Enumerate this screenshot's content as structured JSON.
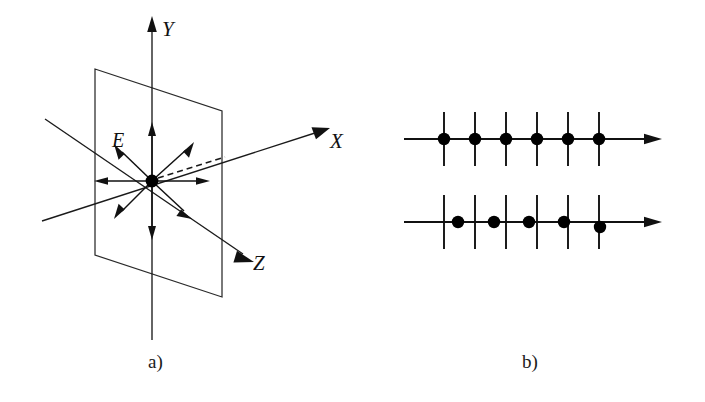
{
  "figure": {
    "background_color": "#ffffff",
    "ink_color": "#111111",
    "panels": [
      {
        "id": "a",
        "caption": "a)",
        "caption_x": 148,
        "caption_y": 368,
        "description": "Three-dimensional coordinate system with electric field vector burst in a plane",
        "axes": [
          {
            "name": "Y",
            "label": "Y",
            "label_x": 162,
            "label_y": 36,
            "direction": "up"
          },
          {
            "name": "X",
            "label": "X",
            "label_x": 330,
            "label_y": 148,
            "direction": "upper-right"
          },
          {
            "name": "Z",
            "label": "Z",
            "label_x": 253,
            "label_y": 270,
            "direction": "lower-right"
          }
        ],
        "field_label": {
          "text": "E",
          "x": 112,
          "y": 147
        },
        "origin": {
          "x": 152,
          "y": 181
        },
        "plane_corners": [
          {
            "x": 95,
            "y": 69
          },
          {
            "x": 222,
            "y": 111
          },
          {
            "x": 222,
            "y": 297
          },
          {
            "x": 95,
            "y": 255
          }
        ],
        "field_arrow_count": 8,
        "has_dashed_ray": true
      },
      {
        "id": "b",
        "caption": "b)",
        "caption_x": 522,
        "caption_y": 368,
        "description": "Two wave axes with tick marks; top row dots aligned on ticks, bottom row dots progressively shifted right",
        "rows": [
          {
            "name": "in-phase-row",
            "axis_y": 139,
            "axis_x_start": 404,
            "axis_x_end": 648,
            "tick_count": 6,
            "tick_first_x": 444,
            "tick_spacing": 31,
            "tick_half_height": 27,
            "dot_count": 6,
            "dot_offsets": [
              0,
              0,
              0,
              0,
              0,
              0
            ],
            "dot_radius": 6.2
          },
          {
            "name": "drifting-phase-row",
            "axis_y": 222,
            "axis_x_start": 404,
            "axis_x_end": 648,
            "tick_count": 6,
            "tick_first_x": 444,
            "tick_spacing": 31,
            "tick_half_height": 27,
            "dot_count": 5,
            "dot_offsets": [
              14,
              19,
              23,
              27,
              32
            ],
            "dot_radius": 6.2
          }
        ]
      }
    ]
  }
}
